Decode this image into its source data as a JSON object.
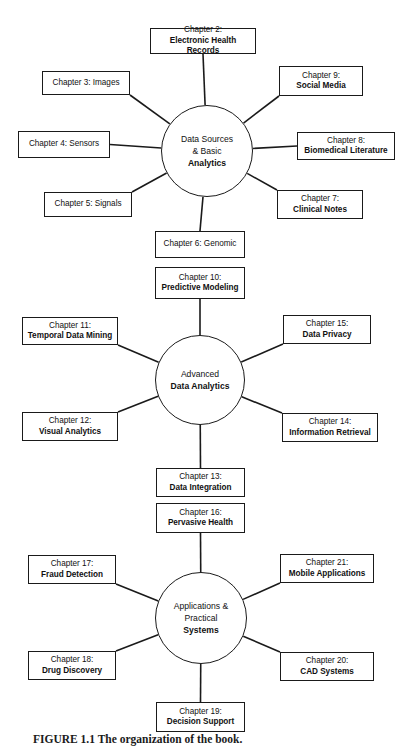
{
  "figure": {
    "caption": "FIGURE 1.1 The organization of the book.",
    "line_color": "#1a1a1a",
    "box_fill": "#ffffff",
    "background": "#ffffff"
  },
  "hubs": [
    {
      "id": "hub-data-sources",
      "lines": [
        "Data Sources",
        "& Basic",
        "Analytics"
      ],
      "cx": 207,
      "cy": 151,
      "r": 46
    },
    {
      "id": "hub-advanced-analytics",
      "lines": [
        "Advanced",
        "Data Analytics"
      ],
      "cx": 200,
      "cy": 380,
      "r": 45
    },
    {
      "id": "hub-applications",
      "lines": [
        "Applications &",
        "Practical",
        "Systems"
      ],
      "cx": 201,
      "cy": 618,
      "r": 46
    }
  ],
  "nodes": [
    {
      "id": "chapter-2",
      "title": "Chapter 2:",
      "subtitle": "Electronic Health Records",
      "x": 150,
      "y": 28,
      "w": 106,
      "h": 26,
      "hub": 0,
      "attach": "top"
    },
    {
      "id": "chapter-3",
      "title": "Chapter 3: Images",
      "subtitle": "",
      "x": 42,
      "y": 71,
      "w": 88,
      "h": 24,
      "hub": 0,
      "attach": "corner-br"
    },
    {
      "id": "chapter-9",
      "title": "Chapter 9:",
      "subtitle": "Social Media",
      "x": 279,
      "y": 66,
      "w": 84,
      "h": 30,
      "hub": 0,
      "attach": "corner-bl"
    },
    {
      "id": "chapter-4",
      "title": "Chapter 4: Sensors",
      "subtitle": "",
      "x": 18,
      "y": 131,
      "w": 92,
      "h": 27,
      "hub": 0,
      "attach": "right"
    },
    {
      "id": "chapter-8",
      "title": "Chapter 8:",
      "subtitle": "Biomedical Literature",
      "x": 297,
      "y": 132,
      "w": 98,
      "h": 28,
      "hub": 0,
      "attach": "left"
    },
    {
      "id": "chapter-5",
      "title": "Chapter 5: Signals",
      "subtitle": "",
      "x": 44,
      "y": 192,
      "w": 88,
      "h": 25,
      "hub": 0,
      "attach": "corner-tr"
    },
    {
      "id": "chapter-7",
      "title": "Chapter 7:",
      "subtitle": "Clinical Notes",
      "x": 277,
      "y": 190,
      "w": 86,
      "h": 29,
      "hub": 0,
      "attach": "corner-tl"
    },
    {
      "id": "chapter-6",
      "title": "Chapter 6: Genomic",
      "subtitle": "",
      "x": 155,
      "y": 231,
      "w": 90,
      "h": 27,
      "hub": 0,
      "attach": "bottom"
    },
    {
      "id": "chapter-10",
      "title": "Chapter 10:",
      "subtitle": "Predictive Modeling",
      "x": 155,
      "y": 267,
      "w": 90,
      "h": 32,
      "hub": 1,
      "attach": "top"
    },
    {
      "id": "chapter-11",
      "title": "Chapter 11:",
      "subtitle": "Temporal Data Mining",
      "x": 22,
      "y": 317,
      "w": 96,
      "h": 28,
      "hub": 1,
      "attach": "corner-br"
    },
    {
      "id": "chapter-15",
      "title": "Chapter 15:",
      "subtitle": "Data Privacy",
      "x": 283,
      "y": 315,
      "w": 88,
      "h": 29,
      "hub": 1,
      "attach": "corner-bl"
    },
    {
      "id": "chapter-12",
      "title": "Chapter 12:",
      "subtitle": "Visual Analytics",
      "x": 22,
      "y": 412,
      "w": 96,
      "h": 29,
      "hub": 1,
      "attach": "corner-tr"
    },
    {
      "id": "chapter-14",
      "title": "Chapter 14:",
      "subtitle": "Information Retrieval",
      "x": 282,
      "y": 413,
      "w": 96,
      "h": 29,
      "hub": 1,
      "attach": "corner-tl"
    },
    {
      "id": "chapter-13",
      "title": "Chapter 13:",
      "subtitle": "Data Integration",
      "x": 156,
      "y": 468,
      "w": 89,
      "h": 29,
      "hub": 1,
      "attach": "bottom"
    },
    {
      "id": "chapter-16",
      "title": "Chapter 16:",
      "subtitle": "Pervasive Health",
      "x": 156,
      "y": 503,
      "w": 89,
      "h": 30,
      "hub": 2,
      "attach": "top"
    },
    {
      "id": "chapter-17",
      "title": "Chapter 17:",
      "subtitle": "Fraud Detection",
      "x": 28,
      "y": 555,
      "w": 88,
      "h": 29,
      "hub": 2,
      "attach": "corner-br"
    },
    {
      "id": "chapter-21",
      "title": "Chapter 21:",
      "subtitle": "Mobile Applications",
      "x": 280,
      "y": 554,
      "w": 94,
      "h": 29,
      "hub": 2,
      "attach": "corner-bl"
    },
    {
      "id": "chapter-18",
      "title": "Chapter 18:",
      "subtitle": "Drug Discovery",
      "x": 28,
      "y": 651,
      "w": 88,
      "h": 29,
      "hub": 2,
      "attach": "corner-tr"
    },
    {
      "id": "chapter-20",
      "title": "Chapter 20:",
      "subtitle": "CAD Systems",
      "x": 280,
      "y": 652,
      "w": 94,
      "h": 29,
      "hub": 2,
      "attach": "corner-tl"
    },
    {
      "id": "chapter-19",
      "title": "Chapter 19:",
      "subtitle": "Decision Support",
      "x": 156,
      "y": 702,
      "w": 89,
      "h": 30,
      "hub": 2,
      "attach": "bottom"
    }
  ]
}
